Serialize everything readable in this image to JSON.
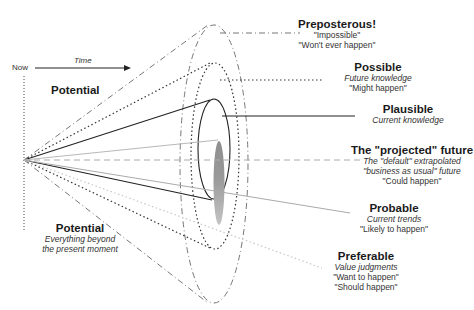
{
  "header": {
    "now_label": "Now",
    "time_label": "Time"
  },
  "left_labels": {
    "potential_top": "Potential",
    "potential_bottom": "Potential",
    "potential_bottom_desc1": "Everything beyond",
    "potential_bottom_desc2": "the present moment"
  },
  "futures": [
    {
      "title": "Preposterous!",
      "desc": [],
      "quotes": [
        "\"Impossible\"",
        "\"Won't ever happen\""
      ],
      "line_style": "dash-dot"
    },
    {
      "title": "Possible",
      "desc": [
        "Future knowledge"
      ],
      "quotes": [
        "\"Might happen\""
      ],
      "line_style": "dotted"
    },
    {
      "title": "Plausible",
      "desc": [
        "Current knowledge"
      ],
      "quotes": [],
      "line_style": "solid"
    },
    {
      "title": "The \"projected\" future",
      "desc": [
        "The \"default\" extrapolated",
        "\"business as usual\" future"
      ],
      "quotes": [
        "\"Could happen\""
      ],
      "line_style": "dashed-gray"
    },
    {
      "title": "Probable",
      "desc": [
        "Current trends"
      ],
      "quotes": [
        "\"Likely to happen\""
      ],
      "line_style": "solid-gray"
    },
    {
      "title": "Preferable",
      "desc": [
        "Value judgments"
      ],
      "quotes": [
        "\"Want to happen\"",
        "\"Should happen\""
      ],
      "line_style": "dotted-gray"
    }
  ],
  "colors": {
    "dark": "#333333",
    "gray": "#9a9a9a",
    "light_gray": "#c8c8c8",
    "blob": "#a0a0a0"
  }
}
